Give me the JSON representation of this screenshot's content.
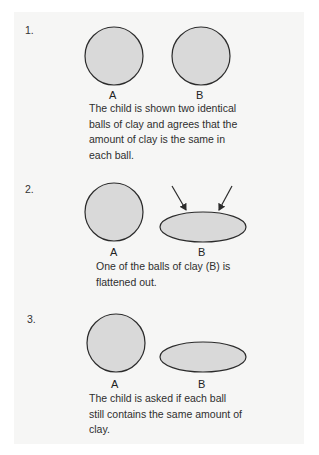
{
  "colors": {
    "background": "#ffffff",
    "panel": "#f6f6f5",
    "shape_fill": "#d9d9d9",
    "shape_stroke": "#2b2b2b",
    "text": "#2e2e2e"
  },
  "steps": [
    {
      "number": "1.",
      "label_a": "A",
      "label_b": "B",
      "shape_a": "circle",
      "shape_b": "circle",
      "caption_lines": [
        "The child is shown two identical",
        "balls of clay and agrees that the",
        "amount of clay is the same in",
        "each ball."
      ]
    },
    {
      "number": "2.",
      "label_a": "A",
      "label_b": "B",
      "shape_a": "circle",
      "shape_b": "ellipse",
      "arrows": 2,
      "caption_lines": [
        "One of the balls of clay (B) is",
        "flattened out."
      ]
    },
    {
      "number": "3.",
      "label_a": "A",
      "label_b": "B",
      "shape_a": "circle",
      "shape_b": "ellipse",
      "caption_lines": [
        "The child is asked if each ball",
        "still contains the same amount of",
        "clay."
      ]
    }
  ]
}
